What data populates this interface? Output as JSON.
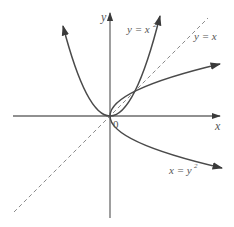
{
  "diagram": {
    "title": "",
    "axes": {
      "x_label": "x",
      "y_label": "y",
      "origin_label": "0"
    },
    "curves": [
      {
        "id": "parabola-up",
        "equation": "y = x^2",
        "label_main": "y = x",
        "label_sup": "2",
        "style": "solid"
      },
      {
        "id": "parabola-right",
        "equation": "x = y^2",
        "label_main": "x = y",
        "label_sup": "2",
        "style": "solid"
      },
      {
        "id": "line-diagonal",
        "equation": "y = x",
        "label_main": "y = x",
        "label_sup": "",
        "style": "dashed"
      }
    ],
    "intersections": [
      [
        0,
        0
      ],
      [
        1,
        1
      ]
    ],
    "colors": {
      "axis": "#6b6b6b",
      "curve": "#4a4a4a",
      "dashed": "#8a8a8a",
      "text": "#555555"
    }
  }
}
